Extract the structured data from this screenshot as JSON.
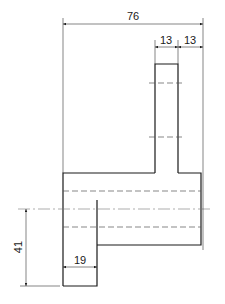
{
  "drawing": {
    "type": "orthographic technical drawing",
    "line_color": "#1a1a1a",
    "background": "#ffffff"
  },
  "dimensions": {
    "overall_width": "76",
    "post_width": "13",
    "post_offset": "13",
    "left_block_width": "19",
    "left_block_height": "41"
  }
}
